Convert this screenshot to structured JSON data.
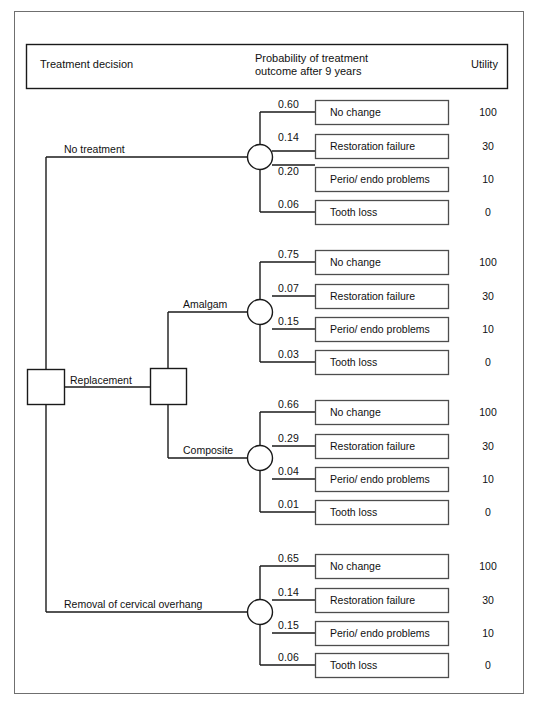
{
  "figure": {
    "type": "decision-tree",
    "header": {
      "col1": "Treatment decision",
      "col2_line1": "Probability of treatment",
      "col2_line2": "outcome after 9 years",
      "col3": "Utility"
    },
    "root_label": "Replacement",
    "branches": [
      {
        "id": "no-treatment",
        "label": "No treatment",
        "outcomes": [
          {
            "probability": "0.60",
            "outcome": "No change",
            "utility": "100"
          },
          {
            "probability": "0.14",
            "outcome": "Restoration failure",
            "utility": "30"
          },
          {
            "probability": "0.20",
            "outcome": "Perio/ endo problems",
            "utility": "10"
          },
          {
            "probability": "0.06",
            "outcome": "Tooth loss",
            "utility": "0"
          }
        ]
      },
      {
        "id": "amalgam",
        "label": "Amalgam",
        "outcomes": [
          {
            "probability": "0.75",
            "outcome": "No change",
            "utility": "100"
          },
          {
            "probability": "0.07",
            "outcome": "Restoration failure",
            "utility": "30"
          },
          {
            "probability": "0.15",
            "outcome": "Perio/ endo problems",
            "utility": "10"
          },
          {
            "probability": "0.03",
            "outcome": "Tooth loss",
            "utility": "0"
          }
        ]
      },
      {
        "id": "composite",
        "label": "Composite",
        "outcomes": [
          {
            "probability": "0.66",
            "outcome": "No change",
            "utility": "100"
          },
          {
            "probability": "0.29",
            "outcome": "Restoration failure",
            "utility": "30"
          },
          {
            "probability": "0.04",
            "outcome": "Perio/ endo problems",
            "utility": "10"
          },
          {
            "probability": "0.01",
            "outcome": "Tooth loss",
            "utility": "0"
          }
        ]
      },
      {
        "id": "removal-of-cervical-overhang",
        "label": "Removal of cervical overhang",
        "outcomes": [
          {
            "probability": "0.65",
            "outcome": "No change",
            "utility": "100"
          },
          {
            "probability": "0.14",
            "outcome": "Restoration failure",
            "utility": "30"
          },
          {
            "probability": "0.15",
            "outcome": "Perio/ endo problems",
            "utility": "10"
          },
          {
            "probability": "0.06",
            "outcome": "Tooth loss",
            "utility": "0"
          }
        ]
      }
    ],
    "colors": {
      "line": "#1a1a1a",
      "frame": "#6f6f6f",
      "box_border": "#4d4d4d",
      "background": "#ffffff"
    }
  }
}
